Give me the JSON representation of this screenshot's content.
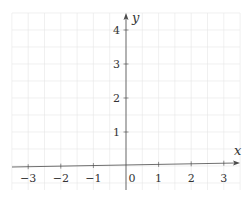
{
  "chart_data": {
    "type": "line",
    "title": "",
    "xlabel": "x",
    "ylabel": "y",
    "xlim": [
      -3.5,
      3.5
    ],
    "ylim": [
      -0.7,
      4.5
    ],
    "x_ticks": [
      -3,
      -2,
      -1,
      0,
      1,
      2,
      3
    ],
    "x_tick_labels": [
      "−3",
      "−2",
      "−1",
      "0",
      "1",
      "2",
      "3"
    ],
    "y_ticks": [
      1,
      2,
      3,
      4
    ],
    "y_tick_labels": [
      "1",
      "2",
      "3",
      "4"
    ],
    "grid": true,
    "grid_step": 0.5,
    "legend": null,
    "series": []
  },
  "colors": {
    "grid": "#e6e6e6",
    "axis": "#4a4a4a",
    "text": "#333333",
    "background": "#ffffff"
  }
}
